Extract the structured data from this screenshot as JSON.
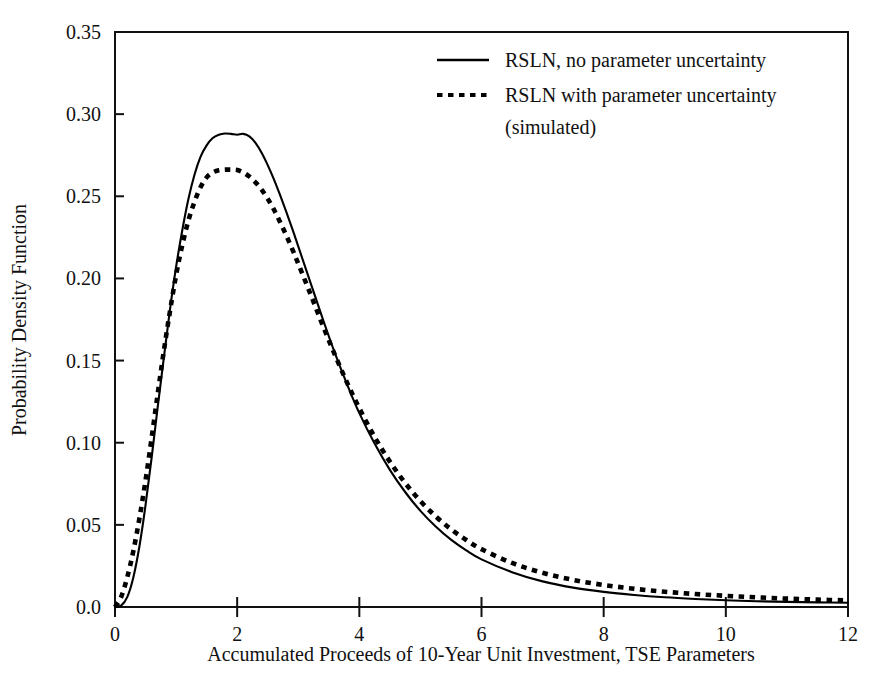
{
  "chart_data": {
    "type": "line",
    "title": "",
    "xlabel": "Accumulated Proceeds of 10-Year Unit Investment, TSE Parameters",
    "ylabel": "Probability Density Function",
    "xlim": [
      0,
      12
    ],
    "ylim": [
      0.0,
      0.35
    ],
    "grid": false,
    "legend_position": "top-center-right",
    "xticks": [
      "0",
      "2",
      "4",
      "6",
      "8",
      "10",
      "12"
    ],
    "xtick_values": [
      0,
      2,
      4,
      6,
      8,
      10,
      12
    ],
    "yticks": [
      "0.0",
      "0.05",
      "0.10",
      "0.15",
      "0.20",
      "0.25",
      "0.30",
      "0.35"
    ],
    "ytick_values": [
      0.0,
      0.05,
      0.1,
      0.15,
      0.2,
      0.25,
      0.3,
      0.35
    ],
    "x": [
      0.0,
      0.1,
      0.2,
      0.3,
      0.4,
      0.5,
      0.6,
      0.7,
      0.8,
      0.9,
      1.0,
      1.1,
      1.2,
      1.3,
      1.4,
      1.5,
      1.6,
      1.7,
      1.8,
      1.9,
      2.0,
      2.1,
      2.2,
      2.3,
      2.4,
      2.5,
      2.6,
      2.7,
      2.8,
      2.9,
      3.0,
      3.2,
      3.4,
      3.6,
      3.8,
      4.0,
      4.25,
      4.5,
      4.75,
      5.0,
      5.25,
      5.5,
      5.75,
      6.0,
      6.5,
      7.0,
      7.5,
      8.0,
      8.5,
      9.0,
      9.5,
      10.0,
      10.5,
      11.0,
      11.5,
      12.0
    ],
    "series": [
      {
        "name": "RSLN, no parameter uncertainty",
        "style": "solid",
        "peak_x": 2.1,
        "peak_y": 0.288,
        "values": [
          0.0,
          0.0008,
          0.006,
          0.018,
          0.037,
          0.062,
          0.091,
          0.122,
          0.152,
          0.181,
          0.207,
          0.229,
          0.248,
          0.263,
          0.274,
          0.281,
          0.2855,
          0.2875,
          0.2882,
          0.288,
          0.2875,
          0.288,
          0.2865,
          0.2825,
          0.2765,
          0.269,
          0.2605,
          0.251,
          0.241,
          0.2305,
          0.2195,
          0.1975,
          0.1755,
          0.1545,
          0.1355,
          0.118,
          0.0995,
          0.0835,
          0.07,
          0.0585,
          0.049,
          0.041,
          0.0345,
          0.029,
          0.0212,
          0.0156,
          0.0118,
          0.0092,
          0.0073,
          0.0059,
          0.0049,
          0.0041,
          0.0035,
          0.0031,
          0.0028,
          0.0026
        ]
      },
      {
        "name": "RSLN with parameter uncertainty (simulated)",
        "style": "dashed",
        "peak_x": 2.0,
        "peak_y": 0.266,
        "values": [
          0.0,
          0.006,
          0.018,
          0.034,
          0.054,
          0.077,
          0.103,
          0.13,
          0.156,
          0.18,
          0.202,
          0.22,
          0.235,
          0.2465,
          0.2555,
          0.2615,
          0.2645,
          0.2658,
          0.2662,
          0.2662,
          0.266,
          0.2645,
          0.262,
          0.2585,
          0.254,
          0.2485,
          0.242,
          0.2345,
          0.2265,
          0.218,
          0.209,
          0.1905,
          0.1715,
          0.1535,
          0.1365,
          0.121,
          0.1035,
          0.0885,
          0.0755,
          0.0645,
          0.0552,
          0.0474,
          0.0408,
          0.0352,
          0.0268,
          0.0208,
          0.0165,
          0.0134,
          0.0111,
          0.0093,
          0.0079,
          0.0068,
          0.0059,
          0.0051,
          0.0045,
          0.004
        ]
      }
    ],
    "legend": [
      {
        "label": "RSLN, no parameter uncertainty",
        "style": "solid"
      },
      {
        "label": "RSLN with parameter uncertainty",
        "style": "dashed"
      },
      {
        "label": "(simulated)",
        "style": "none"
      }
    ]
  }
}
